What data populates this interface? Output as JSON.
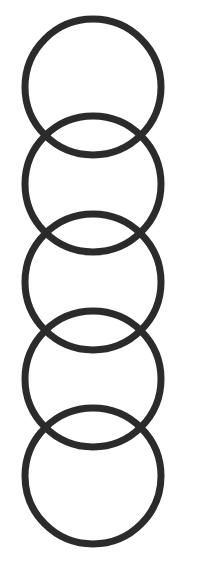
{
  "diagram": {
    "type": "vertical-chain-of-interlocking-rings",
    "ring_count": 5,
    "stroke_color": "#2b2b2b",
    "background": "#ffffff",
    "rings": [
      {
        "cx": 93,
        "cy": 87,
        "r": 68
      },
      {
        "cx": 93,
        "cy": 184,
        "r": 68
      },
      {
        "cx": 93,
        "cy": 282,
        "r": 68
      },
      {
        "cx": 93,
        "cy": 379,
        "r": 68
      },
      {
        "cx": 93,
        "cy": 476,
        "r": 68
      }
    ]
  }
}
